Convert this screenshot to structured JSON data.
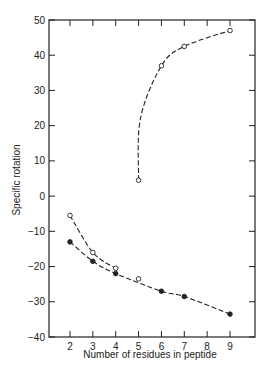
{
  "chart_data": {
    "type": "line",
    "title": "",
    "xlabel": "Number of residues in peptide",
    "ylabel": "Specific rotation",
    "xlim": [
      1,
      10
    ],
    "ylim": [
      -40,
      50
    ],
    "x_ticks": [
      2,
      3,
      4,
      5,
      6,
      7,
      8,
      9
    ],
    "y_ticks": [
      50,
      40,
      30,
      20,
      10,
      0,
      -10,
      -20,
      -30,
      -40
    ],
    "grid": false,
    "legend": null,
    "series": [
      {
        "name": "open-circles-low",
        "marker": "open-circle",
        "line": "dashed",
        "x": [
          2,
          3,
          4
        ],
        "y": [
          -5.5,
          -16,
          -20.5
        ]
      },
      {
        "name": "open-circles-high",
        "marker": "open-circle",
        "line": "dashed",
        "x": [
          5,
          6,
          7,
          9
        ],
        "y": [
          4.5,
          37,
          42.5,
          47
        ]
      },
      {
        "name": "open-circle-single",
        "marker": "open-circle",
        "line": "none",
        "x": [
          5
        ],
        "y": [
          -23.5
        ]
      },
      {
        "name": "filled-circles",
        "marker": "filled-circle",
        "line": "dashed",
        "x": [
          2,
          3,
          4,
          6,
          7,
          9
        ],
        "y": [
          -13,
          -18.5,
          -22,
          -27,
          -28.5,
          -33.5
        ]
      }
    ]
  },
  "colors": {
    "ink": "#222222",
    "background": "#ffffff"
  }
}
